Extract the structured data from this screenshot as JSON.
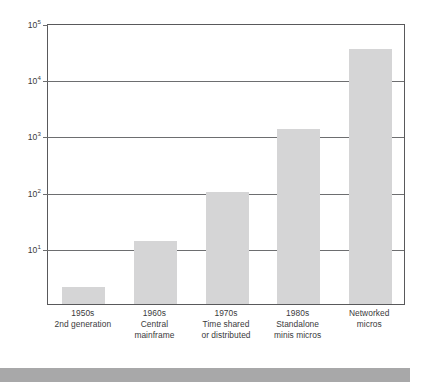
{
  "chart_data": {
    "type": "bar",
    "title": "",
    "subtitle": "",
    "xlabel": "",
    "ylabel": "",
    "scale": "log",
    "ylim": [
      1,
      100000
    ],
    "grid": true,
    "legend": null,
    "y_ticks": [
      {
        "value": 10,
        "label": "10",
        "exponent": "1"
      },
      {
        "value": 100,
        "label": "10",
        "exponent": "2"
      },
      {
        "value": 1000,
        "label": "10",
        "exponent": "3"
      },
      {
        "value": 10000,
        "label": "10",
        "exponent": "4"
      },
      {
        "value": 100000,
        "label": "10",
        "exponent": "5"
      }
    ],
    "categories": [
      {
        "lines": [
          "1950s",
          "2nd generation"
        ]
      },
      {
        "lines": [
          "1960s",
          "Central",
          "mainframe"
        ]
      },
      {
        "lines": [
          "1970s",
          "Time shared",
          "or distributed"
        ]
      },
      {
        "lines": [
          "1980s",
          "Standalone",
          "minis micros"
        ]
      },
      {
        "lines": [
          "Networked",
          "micros"
        ]
      }
    ],
    "values": [
      2,
      13,
      100,
      1300,
      35000
    ],
    "bar_color": "#d5d5d6",
    "axis_color": "#59595b",
    "grid_color": "#6d6e70",
    "text_color": "#3a3a3c"
  },
  "decoration": {
    "bottom_strip_color": "#a8a8a9"
  }
}
